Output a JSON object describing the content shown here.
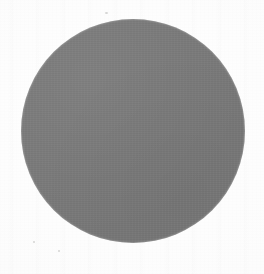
{
  "figure": {
    "kind": "scanned-figure",
    "canvas": {
      "width_px": 264,
      "height_px": 274,
      "background_color": "#fbfbfb"
    },
    "shapes": [
      {
        "name": "gray-disc",
        "type": "circle",
        "fill_color": "#787878",
        "center_x_px": 133,
        "center_y_px": 131,
        "diameter_px": 224,
        "radius_px": 112,
        "left_px": 21,
        "top_px": 19,
        "right_px": 245,
        "bottom_px": 243,
        "stroke": "none"
      }
    ],
    "artifacts": [
      {
        "name": "speck-top-center",
        "x_px": 105,
        "y_px": 12,
        "size_px": 3
      },
      {
        "name": "speck-bottom-left",
        "x_px": 33,
        "y_px": 241,
        "size_px": 2
      },
      {
        "name": "speck-bottom-center",
        "x_px": 58,
        "y_px": 250,
        "size_px": 2
      }
    ],
    "text_content": []
  }
}
